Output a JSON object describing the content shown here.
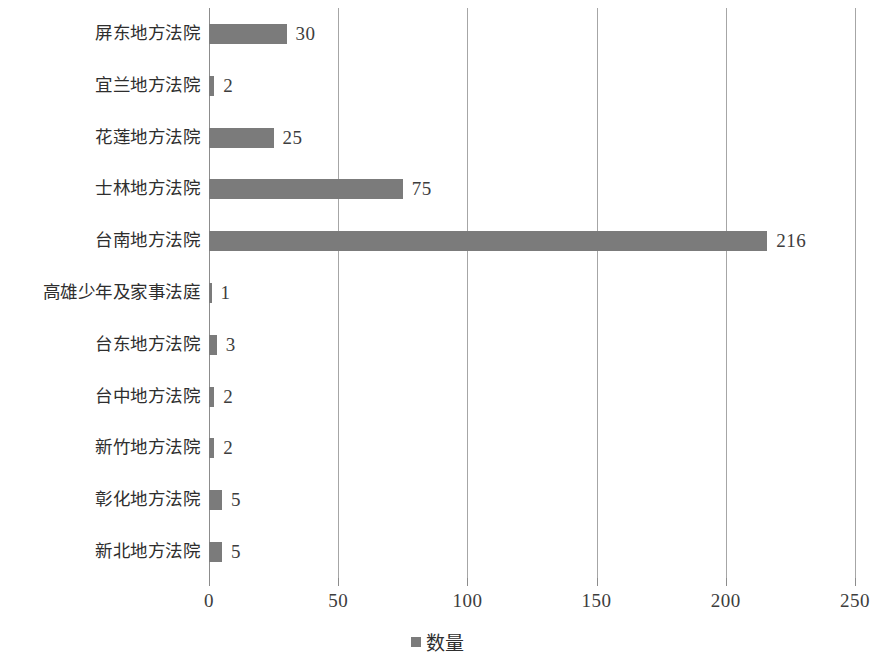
{
  "chart_data": {
    "type": "bar",
    "orientation": "horizontal",
    "title": "",
    "xlabel": "",
    "ylabel": "",
    "xlim": [
      0,
      250
    ],
    "xticks": [
      0,
      50,
      100,
      150,
      200,
      250
    ],
    "xtick_labels": [
      "0",
      "50",
      "100",
      "150",
      "200",
      "250"
    ],
    "grid": "vertical",
    "legend": {
      "position": "bottom-center",
      "entries": [
        {
          "name": "数量",
          "color": "#7b7b7b"
        }
      ]
    },
    "categories": [
      "屏东地方法院",
      "宜兰地方法院",
      "花莲地方法院",
      "士林地方法院",
      "台南地方法院",
      "高雄少年及家事法庭",
      "台东地方法院",
      "台中地方法院",
      "新竹地方法院",
      "彰化地方法院",
      "新北地方法院"
    ],
    "series": [
      {
        "name": "数量",
        "color": "#7b7b7b",
        "values": [
          30,
          2,
          25,
          75,
          216,
          1,
          3,
          2,
          2,
          5,
          5
        ]
      }
    ],
    "data_labels": [
      "30",
      "2",
      "25",
      "75",
      "216",
      "1",
      "3",
      "2",
      "2",
      "5",
      "5"
    ]
  },
  "colors": {
    "bar": "#7b7b7b",
    "gridline": "#a6a6a6",
    "axis": "#8c8c8c",
    "text": "#2e2e2e",
    "background": "#ffffff"
  }
}
